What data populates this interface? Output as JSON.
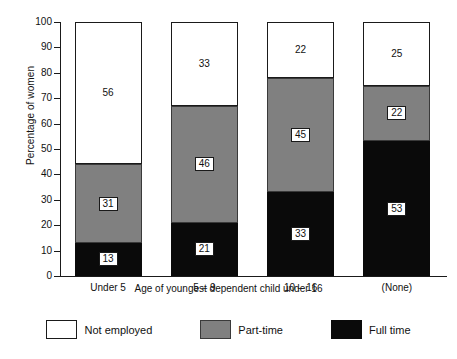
{
  "chart_data": {
    "type": "bar",
    "subtype": "stacked-bar-100",
    "title": "",
    "xlabel": "Age of youngest dependent child under 16",
    "ylabel": "Percentage of women",
    "categories": [
      "Under 5",
      "5 – 9",
      "10 – 16",
      "(None)"
    ],
    "ylim": [
      0,
      100
    ],
    "yticks": [
      0,
      10,
      20,
      30,
      40,
      50,
      60,
      70,
      80,
      90,
      100
    ],
    "ytick_labels": [
      "0",
      "10",
      "20",
      "30",
      "40",
      "50",
      "60",
      "70",
      "80",
      "90",
      "100"
    ],
    "grid": false,
    "legend_position": "bottom",
    "stack_order_bottom_to_top": [
      "Full time",
      "Part-time",
      "Not employed"
    ],
    "series": [
      {
        "name": "Full time",
        "color": "#0a0a0a",
        "values": [
          13,
          21,
          33,
          53
        ]
      },
      {
        "name": "Part-time",
        "color": "#808080",
        "values": [
          31,
          46,
          45,
          22
        ]
      },
      {
        "name": "Not employed",
        "color": "#ffffff",
        "values": [
          56,
          33,
          22,
          25
        ]
      }
    ],
    "data_labels": {
      "Under 5": {
        "Full time": "13",
        "Part-time": "31",
        "Not employed": "56"
      },
      "5 – 9": {
        "Full time": "21",
        "Part-time": "46",
        "Not employed": "33"
      },
      "10 – 16": {
        "Full time": "33",
        "Part-time": "45",
        "Not employed": "22"
      },
      "(None)": {
        "Full time": "53",
        "Part-time": "22",
        "Not employed": "25"
      }
    }
  },
  "axis": {
    "y_title": "Percentage of women",
    "x_title": "Age of youngest dependent child under 16",
    "y_ticks": [
      "100",
      "90",
      "80",
      "70",
      "60",
      "50",
      "40",
      "30",
      "20",
      "10",
      "0"
    ],
    "x_ticks": [
      "Under 5",
      "5 – 9",
      "10 – 16",
      "(None)"
    ]
  },
  "legend": {
    "items": [
      {
        "label": "Not employed",
        "color": "#ffffff"
      },
      {
        "label": "Part-time",
        "color": "#808080"
      },
      {
        "label": "Full time",
        "color": "#0a0a0a"
      }
    ]
  },
  "bars": [
    {
      "category": "Under 5",
      "segments": [
        {
          "series": "Full time",
          "value": 13,
          "label": "13"
        },
        {
          "series": "Part-time",
          "value": 31,
          "label": "31"
        },
        {
          "series": "Not employed",
          "value": 56,
          "label": "56"
        }
      ]
    },
    {
      "category": "5 – 9",
      "segments": [
        {
          "series": "Full time",
          "value": 21,
          "label": "21"
        },
        {
          "series": "Part-time",
          "value": 46,
          "label": "46"
        },
        {
          "series": "Not employed",
          "value": 33,
          "label": "33"
        }
      ]
    },
    {
      "category": "10 – 16",
      "segments": [
        {
          "series": "Full time",
          "value": 33,
          "label": "33"
        },
        {
          "series": "Part-time",
          "value": 45,
          "label": "45"
        },
        {
          "series": "Not employed",
          "value": 22,
          "label": "22"
        }
      ]
    },
    {
      "category": "(None)",
      "segments": [
        {
          "series": "Full time",
          "value": 53,
          "label": "53"
        },
        {
          "series": "Part-time",
          "value": 22,
          "label": "22"
        },
        {
          "series": "Not employed",
          "value": 25,
          "label": "25"
        }
      ]
    }
  ]
}
